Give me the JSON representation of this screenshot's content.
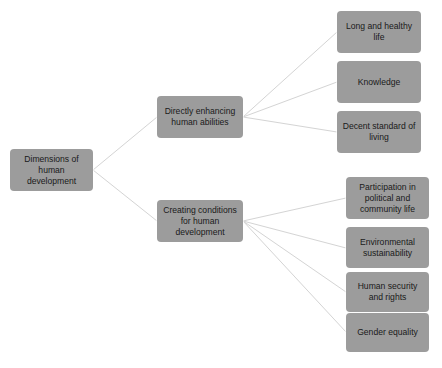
{
  "diagram": {
    "type": "tree",
    "colors": {
      "node_fill": "#9c9c9c",
      "connector": "#d4d4d4",
      "text": "#1a1a1a",
      "background": "#ffffff"
    },
    "root": {
      "label": "Dimensions of human development",
      "children": [
        {
          "label": "Directly enhancing human abilities",
          "children": [
            {
              "label": "Long and healthy life"
            },
            {
              "label": "Knowledge"
            },
            {
              "label": "Decent standard of living"
            }
          ]
        },
        {
          "label": "Creating conditions for human development",
          "children": [
            {
              "label": "Participation in political and community life"
            },
            {
              "label": "Environmental sustainability"
            },
            {
              "label": "Human security and rights"
            },
            {
              "label": "Gender equality"
            }
          ]
        }
      ]
    }
  }
}
